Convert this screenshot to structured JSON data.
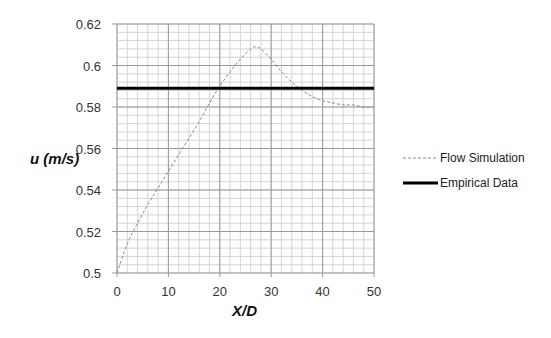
{
  "chart_data": {
    "type": "line",
    "title": "",
    "xlabel": "X/D",
    "ylabel": "u (m/s)",
    "xlim": [
      0,
      50
    ],
    "ylim": [
      0.5,
      0.62
    ],
    "x_ticks": [
      0,
      10,
      20,
      30,
      40,
      50
    ],
    "y_ticks": [
      0.5,
      0.52,
      0.54,
      0.56,
      0.58,
      0.6,
      0.62
    ],
    "y_tick_labels": [
      "0.5",
      "0.52",
      "0.54",
      "0.56",
      "0.58",
      "0.6",
      "0.62"
    ],
    "x_tick_labels": [
      "0",
      "10",
      "20",
      "30",
      "40",
      "50"
    ],
    "grid": true,
    "minor_grid": true,
    "legend_position": "right",
    "series": [
      {
        "name": "Flow Simulation",
        "style": "dashed",
        "color": "#888888",
        "x": [
          0,
          2,
          4,
          6,
          8,
          10,
          12,
          14,
          16,
          18,
          20,
          22,
          24,
          26,
          27,
          28,
          30,
          32,
          34,
          36,
          38,
          40,
          42,
          44,
          46,
          48,
          50
        ],
        "y": [
          0.5,
          0.514,
          0.524,
          0.533,
          0.541,
          0.549,
          0.557,
          0.565,
          0.573,
          0.582,
          0.59,
          0.597,
          0.603,
          0.608,
          0.609,
          0.608,
          0.603,
          0.597,
          0.592,
          0.588,
          0.585,
          0.583,
          0.582,
          0.581,
          0.581,
          0.58,
          0.58
        ]
      },
      {
        "name": "Empirical Data",
        "style": "solid-thick",
        "color": "#000000",
        "x": [
          0,
          50
        ],
        "y": [
          0.589,
          0.589
        ]
      }
    ]
  }
}
